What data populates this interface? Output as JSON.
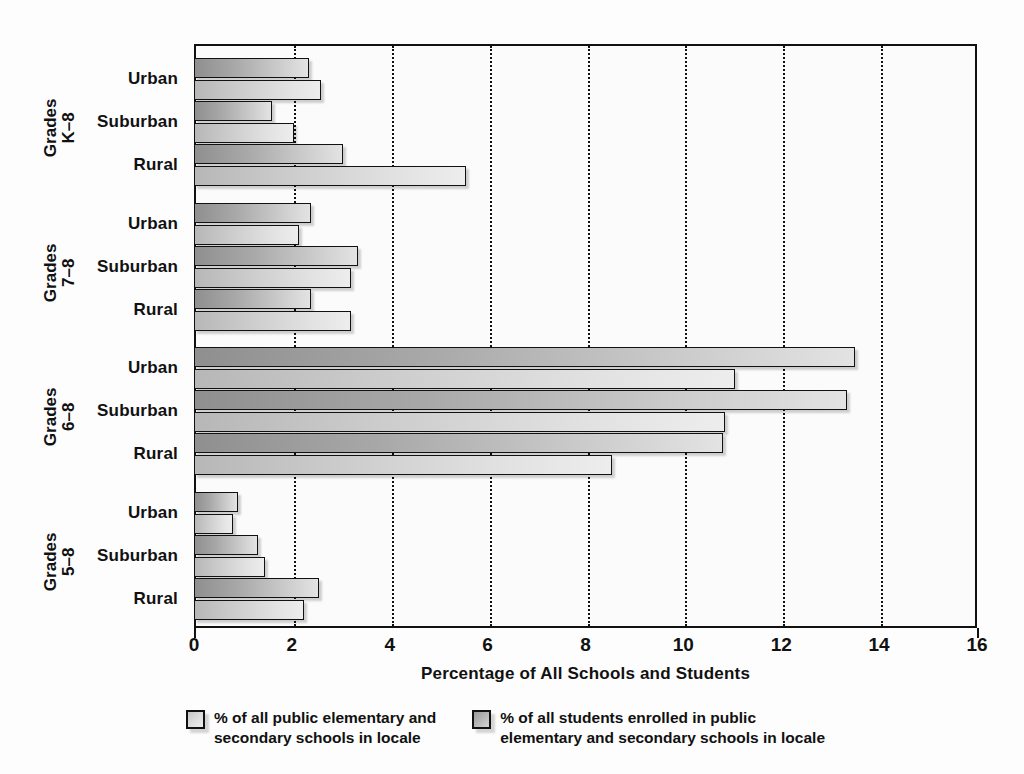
{
  "chart_data": {
    "type": "bar",
    "orientation": "horizontal",
    "title": "",
    "xlabel": "Percentage of All Schools and Students",
    "ylabel": "",
    "xlim": [
      0,
      16
    ],
    "xticks": [
      0,
      2,
      4,
      6,
      8,
      10,
      12,
      14,
      16
    ],
    "xtick_labels": [
      "0",
      "2",
      "4",
      "6",
      "8",
      "10",
      "12",
      "14",
      "16"
    ],
    "grid": "vertical-dotted",
    "legend_position": "bottom",
    "groups": [
      {
        "group_label_line1": "Grades",
        "group_label_line2": "K–8",
        "categories": [
          "Urban",
          "Suburban",
          "Rural"
        ]
      },
      {
        "group_label_line1": "Grades",
        "group_label_line2": "7–8",
        "categories": [
          "Urban",
          "Suburban",
          "Rural"
        ]
      },
      {
        "group_label_line1": "Grades",
        "group_label_line2": "6–8",
        "categories": [
          "Urban",
          "Suburban",
          "Rural"
        ]
      },
      {
        "group_label_line1": "Grades",
        "group_label_line2": "5–8",
        "categories": [
          "Urban",
          "Suburban",
          "Rural"
        ]
      }
    ],
    "categories": [
      "Grades K-8 Urban",
      "Grades K-8 Suburban",
      "Grades K-8 Rural",
      "Grades 7-8 Urban",
      "Grades 7-8 Suburban",
      "Grades 7-8 Rural",
      "Grades 6-8 Urban",
      "Grades 6-8 Suburban",
      "Grades 6-8 Rural",
      "Grades 5-8 Urban",
      "Grades 5-8 Suburban",
      "Grades 5-8 Rural"
    ],
    "series": [
      {
        "name": "% of all students enrolled in public elementary and secondary schools in locale",
        "key": "students",
        "color": "#a8a8a8",
        "values": [
          2.35,
          1.6,
          3.05,
          2.4,
          3.35,
          2.4,
          13.5,
          13.35,
          10.8,
          0.9,
          1.3,
          2.55
        ]
      },
      {
        "name": "% of all public elementary and secondary schools in locale",
        "key": "schools",
        "color": "#dddddd",
        "values": [
          2.6,
          2.05,
          5.55,
          2.15,
          3.2,
          3.2,
          11.05,
          10.85,
          8.55,
          0.8,
          1.45,
          2.25
        ]
      }
    ],
    "legend": [
      {
        "swatch": "schools",
        "label": "% of all public elementary and\nsecondary schools in locale"
      },
      {
        "swatch": "students",
        "label": "% of all students enrolled in public\nelementary and secondary schools in locale"
      }
    ]
  }
}
